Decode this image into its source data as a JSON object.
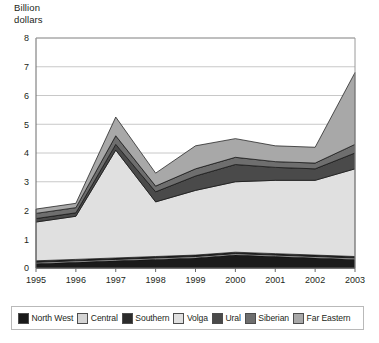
{
  "axis_title": "Billion\ndollars",
  "legend": {
    "items": [
      {
        "label": "North West",
        "color": "#1a1a1a"
      },
      {
        "label": "Central",
        "color": "#d4d4d4"
      },
      {
        "label": "Southern",
        "color": "#2b2b2b"
      },
      {
        "label": "Volga",
        "color": "#e0e0e0"
      },
      {
        "label": "Ural",
        "color": "#4a4a4a"
      },
      {
        "label": "Siberian",
        "color": "#6e6e6e"
      },
      {
        "label": "Far Eastern",
        "color": "#a8a8a8"
      }
    ]
  },
  "chart_data": {
    "type": "area",
    "stacked": true,
    "title": "",
    "xlabel": "",
    "ylabel": "Billion dollars",
    "ylim": [
      0,
      8
    ],
    "yticks": [
      0,
      1,
      2,
      3,
      4,
      5,
      6,
      7,
      8
    ],
    "grid": true,
    "legend_position": "bottom",
    "categories": [
      "1995",
      "1996",
      "1997",
      "1998",
      "1999",
      "2000",
      "2001",
      "2002",
      "2003"
    ],
    "series": [
      {
        "name": "North West",
        "color": "#1a1a1a",
        "values": [
          0.15,
          0.2,
          0.25,
          0.3,
          0.35,
          0.45,
          0.4,
          0.35,
          0.3
        ]
      },
      {
        "name": "Central",
        "color": "#d4d4d4",
        "values": [
          0.05,
          0.05,
          0.05,
          0.05,
          0.05,
          0.05,
          0.05,
          0.05,
          0.05
        ]
      },
      {
        "name": "Southern",
        "color": "#2b2b2b",
        "values": [
          0.05,
          0.05,
          0.05,
          0.05,
          0.05,
          0.05,
          0.05,
          0.05,
          0.05
        ]
      },
      {
        "name": "Volga",
        "color": "#e0e0e0",
        "values": [
          1.35,
          1.5,
          3.75,
          1.9,
          2.25,
          2.45,
          2.55,
          2.6,
          3.05
        ]
      },
      {
        "name": "Ural",
        "color": "#4a4a4a",
        "values": [
          0.12,
          0.12,
          0.2,
          0.35,
          0.5,
          0.6,
          0.45,
          0.4,
          0.55
        ]
      },
      {
        "name": "Siberian",
        "color": "#6e6e6e",
        "values": [
          0.18,
          0.18,
          0.3,
          0.2,
          0.25,
          0.25,
          0.2,
          0.2,
          0.3
        ]
      },
      {
        "name": "Far Eastern",
        "color": "#a8a8a8",
        "values": [
          0.15,
          0.15,
          0.65,
          0.45,
          0.8,
          0.65,
          0.55,
          0.55,
          2.5
        ]
      }
    ],
    "totals": [
      2.05,
      2.25,
      5.25,
      3.3,
      4.25,
      4.5,
      4.25,
      4.2,
      6.8
    ]
  }
}
